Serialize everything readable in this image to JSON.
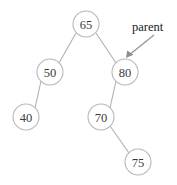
{
  "diagram": {
    "colors": {
      "background": "#ffffff",
      "node_stroke": "#b8b8b8",
      "node_fill": "#ffffff",
      "node_text": "#3a3a3a",
      "edge": "#b0b0b0",
      "pointer": "#8f8f8f",
      "annotation_text": "#1a1a1a"
    },
    "nodes": [
      {
        "id": "n65",
        "label": "65",
        "cx": 86,
        "cy": 24,
        "r": 13
      },
      {
        "id": "n50",
        "label": "50",
        "cx": 50,
        "cy": 72,
        "r": 13
      },
      {
        "id": "n80",
        "label": "80",
        "cx": 125,
        "cy": 72,
        "r": 13
      },
      {
        "id": "n40",
        "label": "40",
        "cx": 26,
        "cy": 117,
        "r": 13
      },
      {
        "id": "n70",
        "label": "70",
        "cx": 101,
        "cy": 117,
        "r": 13
      },
      {
        "id": "n75",
        "label": "75",
        "cx": 138,
        "cy": 162,
        "r": 13
      }
    ],
    "edges": [
      {
        "from": "n65",
        "to": "n50",
        "x1": 76,
        "y1": 33,
        "x2": 59,
        "y2": 63
      },
      {
        "from": "n65",
        "to": "n80",
        "x1": 96,
        "y1": 33,
        "x2": 116,
        "y2": 63
      },
      {
        "from": "n50",
        "to": "n40",
        "x1": 41,
        "y1": 81,
        "x2": 35,
        "y2": 108
      },
      {
        "from": "n80",
        "to": "n70",
        "x1": 116,
        "y1": 81,
        "x2": 110,
        "y2": 108
      },
      {
        "from": "n70",
        "to": "n75",
        "x1": 110,
        "y1": 126,
        "x2": 129,
        "y2": 153
      }
    ],
    "annotations": [
      {
        "id": "parent-pointer",
        "label": "parent",
        "text_x": 132,
        "text_y": 31,
        "arrow_x1": 154,
        "arrow_y1": 35,
        "arrow_x2": 127,
        "arrow_y2": 57,
        "points_to": "n80"
      }
    ]
  }
}
